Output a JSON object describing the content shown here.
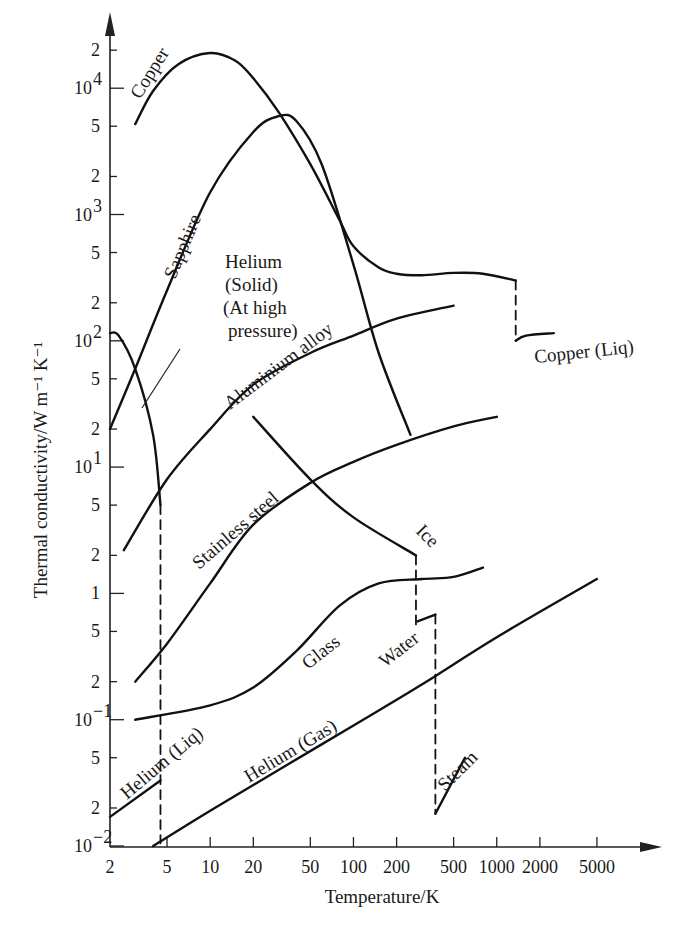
{
  "chart_data": {
    "type": "line",
    "title": "",
    "xlabel": "Temperature/K",
    "ylabel": "Thermal conductivity/W m⁻¹ K⁻¹",
    "xscale": "log",
    "yscale": "log",
    "xlim": [
      2,
      8000
    ],
    "ylim": [
      0.01,
      30000
    ],
    "grid": false,
    "legend": "none (inline curve labels)",
    "x_ticks": [
      {
        "v": 2,
        "label": "2"
      },
      {
        "v": 5,
        "label": "5"
      },
      {
        "v": 10,
        "label": "10"
      },
      {
        "v": 20,
        "label": "20"
      },
      {
        "v": 50,
        "label": "50"
      },
      {
        "v": 100,
        "label": "100"
      },
      {
        "v": 200,
        "label": "200"
      },
      {
        "v": 500,
        "label": "500"
      },
      {
        "v": 1000,
        "label": "1000"
      },
      {
        "v": 2000,
        "label": "2000"
      },
      {
        "v": 5000,
        "label": "5000"
      }
    ],
    "y_ticks": [
      {
        "v": 0.01,
        "label": "10",
        "exp": "−2",
        "major": true
      },
      {
        "v": 0.02,
        "label": "2"
      },
      {
        "v": 0.05,
        "label": "5"
      },
      {
        "v": 0.1,
        "label": "10",
        "exp": "−1",
        "major": true
      },
      {
        "v": 0.2,
        "label": "2"
      },
      {
        "v": 0.5,
        "label": "5"
      },
      {
        "v": 1,
        "label": "1",
        "major": true
      },
      {
        "v": 2,
        "label": "2"
      },
      {
        "v": 5,
        "label": "5"
      },
      {
        "v": 10,
        "label": "10",
        "exp": "1",
        "major": true
      },
      {
        "v": 20,
        "label": "2"
      },
      {
        "v": 50,
        "label": "5"
      },
      {
        "v": 100,
        "label": "10",
        "exp": "2",
        "major": true
      },
      {
        "v": 200,
        "label": "2"
      },
      {
        "v": 500,
        "label": "5"
      },
      {
        "v": 1000,
        "label": "10",
        "exp": "3",
        "major": true
      },
      {
        "v": 2000,
        "label": "2"
      },
      {
        "v": 5000,
        "label": "5"
      },
      {
        "v": 10000,
        "label": "10",
        "exp": "4",
        "major": true
      },
      {
        "v": 20000,
        "label": "2"
      }
    ],
    "series": [
      {
        "name": "Copper",
        "style": "solid",
        "points": [
          [
            3,
            5200
          ],
          [
            4,
            9500
          ],
          [
            6,
            15500
          ],
          [
            10,
            19000
          ],
          [
            15,
            16500
          ],
          [
            20,
            12000
          ],
          [
            30,
            6500
          ],
          [
            50,
            2500
          ],
          [
            80,
            900
          ],
          [
            100,
            560
          ],
          [
            150,
            380
          ],
          [
            200,
            340
          ],
          [
            300,
            330
          ],
          [
            500,
            345
          ],
          [
            800,
            340
          ],
          [
            1356,
            300
          ]
        ]
      },
      {
        "name": "Copper (Liq)",
        "style": "solid",
        "points": [
          [
            1356,
            100
          ],
          [
            1600,
            110
          ],
          [
            2500,
            115
          ]
        ]
      },
      {
        "name": "Copper melting jump",
        "style": "dashed",
        "points": [
          [
            1356,
            300
          ],
          [
            1356,
            100
          ]
        ]
      },
      {
        "name": "Sapphire",
        "style": "solid",
        "points": [
          [
            2,
            20
          ],
          [
            3,
            60
          ],
          [
            5,
            250
          ],
          [
            10,
            1500
          ],
          [
            20,
            4500
          ],
          [
            30,
            6000
          ],
          [
            40,
            5500
          ],
          [
            60,
            2500
          ],
          [
            100,
            400
          ],
          [
            150,
            80
          ],
          [
            250,
            18
          ]
        ]
      },
      {
        "name": "Helium (Solid) (At high pressure)",
        "style": "solid",
        "points": [
          [
            2,
            115
          ],
          [
            2.3,
            110
          ],
          [
            3,
            60
          ],
          [
            4,
            18
          ],
          [
            4.5,
            5
          ]
        ]
      },
      {
        "name": "Helium solid melting",
        "style": "dashed",
        "points": [
          [
            4.5,
            5
          ],
          [
            4.5,
            0.0105
          ]
        ]
      },
      {
        "name": "Aluminium alloy",
        "style": "solid",
        "points": [
          [
            2.5,
            2.2
          ],
          [
            5,
            8
          ],
          [
            10,
            20
          ],
          [
            20,
            45
          ],
          [
            50,
            80
          ],
          [
            100,
            110
          ],
          [
            200,
            150
          ],
          [
            500,
            190
          ]
        ]
      },
      {
        "name": "Stainless steel",
        "style": "solid",
        "points": [
          [
            3,
            0.2
          ],
          [
            5,
            0.4
          ],
          [
            10,
            1.2
          ],
          [
            20,
            3.5
          ],
          [
            50,
            7.5
          ],
          [
            100,
            11
          ],
          [
            200,
            15
          ],
          [
            500,
            21
          ],
          [
            1000,
            25
          ]
        ]
      },
      {
        "name": "Ice",
        "style": "solid",
        "points": [
          [
            20,
            25
          ],
          [
            50,
            8
          ],
          [
            100,
            4
          ],
          [
            273,
            2
          ]
        ]
      },
      {
        "name": "Ice melting",
        "style": "dashed",
        "points": [
          [
            273,
            2
          ],
          [
            273,
            0.56
          ]
        ]
      },
      {
        "name": "Glass",
        "style": "solid",
        "points": [
          [
            3,
            0.1
          ],
          [
            10,
            0.13
          ],
          [
            20,
            0.18
          ],
          [
            40,
            0.35
          ],
          [
            80,
            0.8
          ],
          [
            150,
            1.2
          ],
          [
            300,
            1.3
          ],
          [
            500,
            1.35
          ],
          [
            800,
            1.6
          ]
        ]
      },
      {
        "name": "Water",
        "style": "solid",
        "points": [
          [
            280,
            0.6
          ],
          [
            373,
            0.68
          ]
        ]
      },
      {
        "name": "Water boiling",
        "style": "dashed",
        "points": [
          [
            373,
            0.68
          ],
          [
            373,
            0.018
          ]
        ]
      },
      {
        "name": "Steam",
        "style": "solid",
        "points": [
          [
            373,
            0.018
          ],
          [
            600,
            0.05
          ]
        ]
      },
      {
        "name": "Helium (Liq)",
        "style": "solid",
        "points": [
          [
            2,
            0.017
          ],
          [
            4.5,
            0.033
          ]
        ]
      },
      {
        "name": "Helium (Gas)",
        "style": "solid",
        "points": [
          [
            4,
            0.01
          ],
          [
            10,
            0.019
          ],
          [
            30,
            0.04
          ],
          [
            100,
            0.09
          ],
          [
            300,
            0.19
          ],
          [
            1000,
            0.45
          ],
          [
            5000,
            1.3
          ]
        ]
      }
    ],
    "labels": [
      {
        "text": "Copper",
        "x": 140,
        "y": 100,
        "rot": -58
      },
      {
        "text": "Sapphire",
        "x": 175,
        "y": 280,
        "rot": -67
      },
      {
        "text": "Helium",
        "x": 225,
        "y": 268,
        "rot": 0
      },
      {
        "text": "(Solid)",
        "x": 225,
        "y": 291,
        "rot": 0
      },
      {
        "text": "(At high",
        "x": 223,
        "y": 314,
        "rot": 0
      },
      {
        "text": "pressure)",
        "x": 228,
        "y": 337,
        "rot": 0
      },
      {
        "text": "Aluminium alloy",
        "x": 230,
        "y": 410,
        "rot": -37
      },
      {
        "text": "Copper (Liq)",
        "x": 535,
        "y": 363,
        "rot": -6
      },
      {
        "text": "Stainless steel",
        "x": 199,
        "y": 570,
        "rot": -41
      },
      {
        "text": "Ice",
        "x": 415,
        "y": 532,
        "rot": 45
      },
      {
        "text": "Glass",
        "x": 308,
        "y": 670,
        "rot": -38
      },
      {
        "text": "Water",
        "x": 385,
        "y": 668,
        "rot": -38
      },
      {
        "text": "Helium (Liq)",
        "x": 127,
        "y": 800,
        "rot": -40
      },
      {
        "text": "Helium (Gas)",
        "x": 249,
        "y": 783,
        "rot": -31
      },
      {
        "text": "Steam",
        "x": 445,
        "y": 792,
        "rot": -45
      }
    ]
  }
}
